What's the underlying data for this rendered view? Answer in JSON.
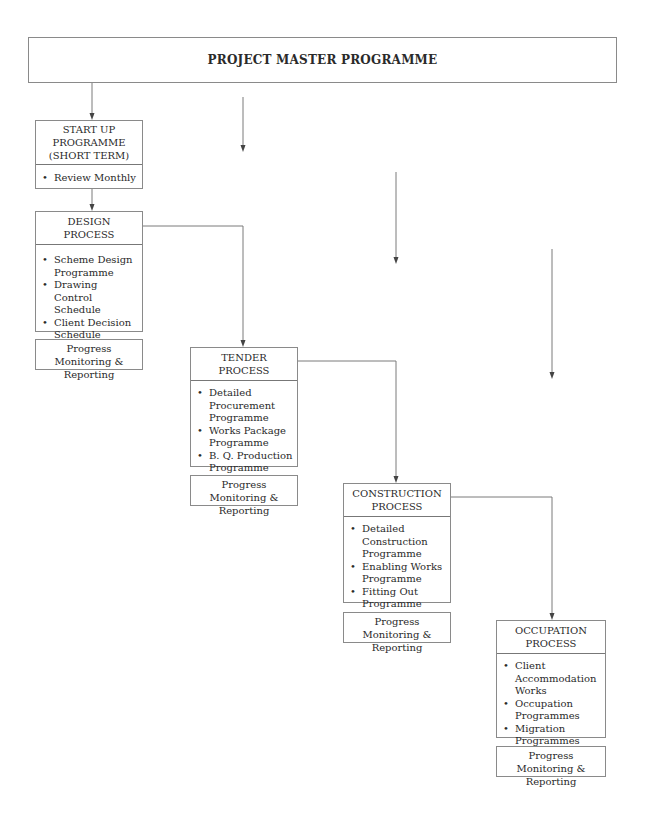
{
  "master": {
    "title": "PROJECT MASTER PROGRAMME"
  },
  "startup": {
    "title_lines": [
      "START UP",
      "PROGRAMME",
      "(SHORT TERM)"
    ],
    "items": [
      "Review Monthly"
    ]
  },
  "design": {
    "title_lines": [
      "DESIGN",
      "PROCESS"
    ],
    "items": [
      "Scheme Design Programme",
      "Drawing Control Schedule",
      "Client Decision Schedule"
    ],
    "footer": "Progress Monitoring & Reporting"
  },
  "tender": {
    "title_lines": [
      "TENDER",
      "PROCESS"
    ],
    "items": [
      "Detailed Procurement Programme",
      "Works Package Programme",
      "B. Q. Production Programme"
    ],
    "footer": "Progress Monitoring & Reporting"
  },
  "construction": {
    "title_lines": [
      "CONSTRUCTION",
      "PROCESS"
    ],
    "items": [
      "Detailed Construction Programme",
      "Enabling Works Programme",
      "Fitting Out Programme"
    ],
    "footer": "Progress Monitoring & Reporting"
  },
  "occupation": {
    "title_lines": [
      "OCCUPATION",
      "PROCESS"
    ],
    "items": [
      "Client Accommodation Works",
      "Occupation Programmes",
      "Migration Programmes"
    ],
    "footer": "Progress Monitoring & Reporting"
  },
  "colors": {
    "line": "#7a7a7a",
    "text": "#2a2a2a",
    "background": "#ffffff"
  }
}
